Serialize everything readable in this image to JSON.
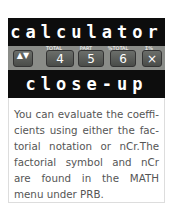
{
  "header": {
    "title_top": "calculator",
    "title_bottom": "close-up"
  },
  "keys": [
    {
      "label": "",
      "glyph": "▲▼"
    },
    {
      "label": "TOTAL",
      "glyph": "4"
    },
    {
      "label": "PART",
      "glyph": "5"
    },
    {
      "label": "%TOTAL",
      "glyph": "6"
    },
    {
      "label": "Σ%",
      "glyph": "×"
    }
  ],
  "body": {
    "text": "You can evaluate the coeffi-cients using either the fac-torial notation or nCr.The factorial symbol and nCr are found in the MATH menu under PRB."
  }
}
